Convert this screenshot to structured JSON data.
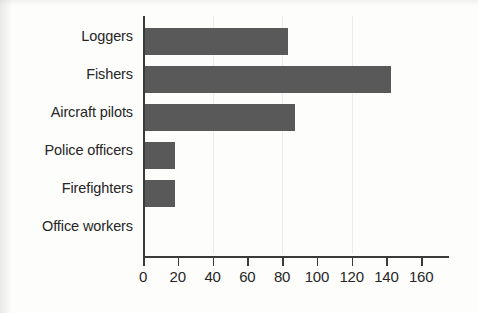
{
  "chart_data": {
    "type": "bar",
    "orientation": "horizontal",
    "title": "",
    "subtitle": "",
    "xlabel": "",
    "ylabel": "",
    "categories": [
      "Loggers",
      "Fishers",
      "Aircraft pilots",
      "Police officers",
      "Firefighters",
      "Office workers"
    ],
    "values": [
      83,
      142,
      87,
      18,
      18,
      0
    ],
    "series": [
      {
        "name": "",
        "values": [
          83,
          142,
          87,
          18,
          18,
          0
        ]
      }
    ],
    "xlim": [
      0,
      176
    ],
    "xticks": [
      0,
      20,
      40,
      60,
      80,
      100,
      120,
      140,
      160
    ],
    "xtick_labels": [
      "0",
      "20",
      "40",
      "60",
      "80",
      "100",
      "120",
      "140",
      "160"
    ],
    "grid": "vertical-minor",
    "legend": "none",
    "bar_color": "#595959",
    "axis_color": "#3a3a3a",
    "gridline_color": "#ececec",
    "background_color": "#fdfdfc"
  }
}
